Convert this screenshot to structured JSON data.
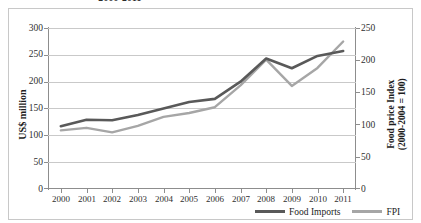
{
  "figure": {
    "title": "2000-2011",
    "frame_color": "#c8c8c8"
  },
  "axes": {
    "left": {
      "title": "US$ million",
      "ticks": [
        "300",
        "250",
        "200",
        "150",
        "100",
        "50",
        "0"
      ],
      "min": 0,
      "max": 300
    },
    "right": {
      "title_line1": "Food price Index",
      "title_line2": "(2000-2004 = 100)",
      "ticks": [
        "250",
        "200",
        "150",
        "100",
        "50",
        "0"
      ],
      "min": 0,
      "max": 250
    },
    "x": {
      "title": "",
      "ticks": [
        "2000",
        "2001",
        "2002",
        "2003",
        "2004",
        "2005",
        "2006",
        "2007",
        "2008",
        "2009",
        "2010",
        "2011"
      ]
    }
  },
  "legend": {
    "position": "bottom-right",
    "entries": [
      {
        "label": "Food Imports",
        "color": "#595959",
        "icon": "line-swatch-dark"
      },
      {
        "label": "FPI",
        "color": "#a6a6a6",
        "icon": "line-swatch-light"
      }
    ]
  },
  "colors": {
    "food_imports": "#595959",
    "fpi": "#a6a6a6",
    "gridline": "#c9c9c9",
    "axis": "#8d8d8d",
    "text": "#2f2f2f"
  },
  "chart_data": {
    "type": "line",
    "title": "2000-2011",
    "xlabel": "",
    "ylabel": "US$ million",
    "y2label": "Food price Index (2000-2004 = 100)",
    "grid": true,
    "legend_position": "bottom-right",
    "categories": [
      "2000",
      "2001",
      "2002",
      "2003",
      "2004",
      "2005",
      "2006",
      "2007",
      "2008",
      "2009",
      "2010",
      "2011"
    ],
    "x": [
      2000,
      2001,
      2002,
      2003,
      2004,
      2005,
      2006,
      2007,
      2008,
      2009,
      2010,
      2011
    ],
    "ylim": [
      0,
      300
    ],
    "y2lim": [
      0,
      250
    ],
    "yticks": [
      0,
      50,
      100,
      150,
      200,
      250,
      300
    ],
    "y2ticks": [
      0,
      50,
      100,
      150,
      200,
      250
    ],
    "series": [
      {
        "name": "Food Imports",
        "axis": "left",
        "unit": "US$ million",
        "color": "#595959",
        "values": [
          117,
          129,
          128,
          138,
          150,
          162,
          168,
          200,
          243,
          225,
          248,
          257
        ]
      },
      {
        "name": "FPI",
        "axis": "right",
        "unit": "index (2000-2004 = 100)",
        "color": "#a6a6a6",
        "values": [
          91,
          95,
          88,
          98,
          112,
          118,
          127,
          161,
          201,
          160,
          188,
          229
        ]
      }
    ]
  }
}
